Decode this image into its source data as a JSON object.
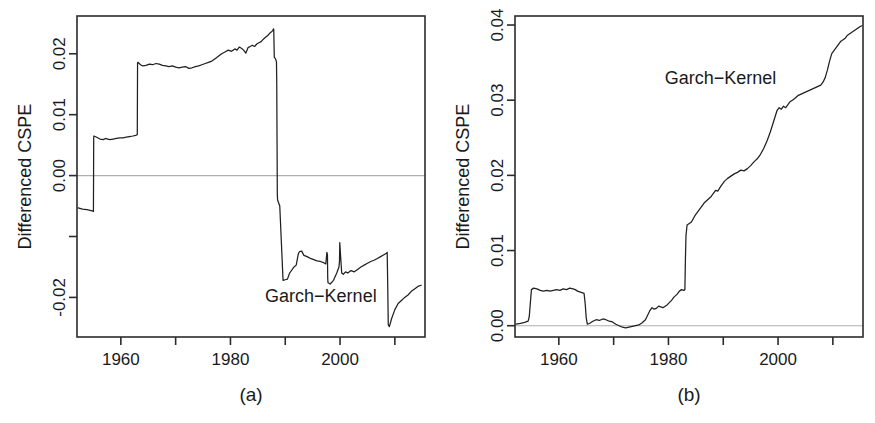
{
  "figure": {
    "width": 875,
    "height": 423,
    "background": "#ffffff",
    "line_color": "#202020",
    "axis_color": "#2b2b2b",
    "zero_line_color": "#aeaeae"
  },
  "chart_data": [
    {
      "id": "panel-a",
      "type": "line",
      "title": "",
      "caption": "(a)",
      "xlabel": "",
      "ylabel": "Differenced CSPE",
      "series_label": "Garch-Kernel",
      "series_label_x": 1996.5,
      "series_label_y": -0.0208,
      "grid": false,
      "zero_line": true,
      "xlim": [
        1952.0,
        2015.5
      ],
      "ylim": [
        -0.0265,
        0.0262
      ],
      "xticks": [
        1960,
        1970,
        1980,
        1990,
        2000,
        2010
      ],
      "xtick_labels": [
        "1960",
        "",
        "1980",
        "",
        "2000",
        ""
      ],
      "yticks": [
        0.02,
        0.01,
        0.0,
        -0.01,
        -0.02
      ],
      "ytick_labels": [
        "0.02",
        "0.01",
        "0.00",
        "",
        "-0.02"
      ],
      "series": [
        {
          "name": "Garch-Kernel",
          "x": [
            1952.2,
            1953.0,
            1953.8,
            1954.4,
            1954.8,
            1955.0,
            1955.05,
            1955.1,
            1955.6,
            1956.2,
            1956.8,
            1957.2,
            1957.6,
            1958.0,
            1958.6,
            1959.2,
            1959.8,
            1960.4,
            1961.0,
            1961.6,
            1962.2,
            1962.7,
            1963.0,
            1963.05,
            1963.1,
            1963.6,
            1964.0,
            1964.6,
            1965.2,
            1965.8,
            1966.4,
            1967.0,
            1967.6,
            1968.2,
            1968.8,
            1969.4,
            1970.0,
            1970.6,
            1971.2,
            1971.8,
            1972.4,
            1973.0,
            1973.6,
            1974.2,
            1974.8,
            1975.4,
            1976.0,
            1976.6,
            1977.2,
            1977.8,
            1978.4,
            1979.0,
            1979.6,
            1980.2,
            1980.8,
            1981.2,
            1981.6,
            1982.0,
            1982.4,
            1982.8,
            1983.2,
            1983.6,
            1984.0,
            1984.4,
            1984.8,
            1985.2,
            1985.6,
            1986.0,
            1986.4,
            1986.8,
            1987.2,
            1987.5,
            1987.7,
            1987.8,
            1987.85,
            1987.9,
            1988.0,
            1988.2,
            1988.3,
            1988.35,
            1988.4,
            1988.45,
            1988.5,
            1988.55,
            1988.6,
            1989.0,
            1989.6,
            1990.0,
            1990.4,
            1990.8,
            1991.2,
            1991.6,
            1992.0,
            1992.4,
            1992.6,
            1993.0,
            1993.4,
            1994.0,
            1994.6,
            1995.2,
            1995.8,
            1996.4,
            1997.0,
            1997.4,
            1997.6,
            1997.7,
            1997.75,
            1997.8,
            1998.2,
            1998.8,
            1999.4,
            1999.8,
            1999.9,
            1999.95,
            2000.0,
            2000.3,
            2000.6,
            2001.0,
            2001.4,
            2002.0,
            2002.6,
            2003.2,
            2003.8,
            2004.4,
            2005.0,
            2005.6,
            2006.2,
            2006.8,
            2007.4,
            2008.0,
            2008.4,
            2008.6,
            2008.7,
            2008.75,
            2008.8,
            2009.0,
            2009.4,
            2010.0,
            2010.6,
            2011.2,
            2011.8,
            2012.4,
            2013.0,
            2013.6,
            2014.2,
            2014.8,
            2015.3
          ],
          "y": [
            -0.0053,
            -0.0055,
            -0.0056,
            -0.0057,
            -0.0058,
            -0.0059,
            0.0063,
            0.0065,
            0.0063,
            0.006,
            0.0059,
            0.0061,
            0.006,
            0.0059,
            0.006,
            0.0061,
            0.0062,
            0.0062,
            0.0063,
            0.0064,
            0.0065,
            0.0066,
            0.0067,
            0.0185,
            0.0186,
            0.0182,
            0.018,
            0.0181,
            0.0183,
            0.0182,
            0.0184,
            0.0183,
            0.0181,
            0.018,
            0.0179,
            0.018,
            0.0178,
            0.0177,
            0.0178,
            0.0179,
            0.0176,
            0.0177,
            0.0179,
            0.018,
            0.0182,
            0.0184,
            0.0186,
            0.0188,
            0.0192,
            0.0196,
            0.02,
            0.0203,
            0.0206,
            0.0204,
            0.0208,
            0.0206,
            0.0211,
            0.0209,
            0.0206,
            0.0201,
            0.021,
            0.0212,
            0.0214,
            0.0212,
            0.0216,
            0.0218,
            0.022,
            0.0224,
            0.0227,
            0.023,
            0.0234,
            0.0236,
            0.0238,
            0.024,
            0.0241,
            0.024,
            0.0194,
            0.0192,
            0.019,
            0.0188,
            0.0186,
            0.015,
            0.006,
            -0.003,
            -0.004,
            -0.005,
            -0.0172,
            -0.0171,
            -0.017,
            -0.016,
            -0.0155,
            -0.015,
            -0.0147,
            -0.0128,
            -0.0125,
            -0.0124,
            -0.0131,
            -0.0133,
            -0.0136,
            -0.0138,
            -0.014,
            -0.0141,
            -0.0143,
            -0.0145,
            -0.0126,
            -0.013,
            -0.0168,
            -0.0176,
            -0.0178,
            -0.0172,
            -0.016,
            -0.015,
            -0.014,
            -0.011,
            -0.0118,
            -0.016,
            -0.0162,
            -0.0158,
            -0.016,
            -0.0156,
            -0.0158,
            -0.0154,
            -0.015,
            -0.0147,
            -0.0144,
            -0.0141,
            -0.0139,
            -0.0136,
            -0.0133,
            -0.013,
            -0.0128,
            -0.0126,
            -0.018,
            -0.0215,
            -0.0245,
            -0.0248,
            -0.0235,
            -0.022,
            -0.021,
            -0.0205,
            -0.02,
            -0.0196,
            -0.019,
            -0.0186,
            -0.0182,
            -0.018
          ]
        }
      ]
    },
    {
      "id": "panel-b",
      "type": "line",
      "title": "",
      "caption": "(b)",
      "xlabel": "",
      "ylabel": "Differenced CSPE",
      "series_label": "Garch-Kernel",
      "series_label_x": 1989.5,
      "series_label_y": 0.0322,
      "grid": false,
      "zero_line": true,
      "xlim": [
        1952.0,
        2015.5
      ],
      "ylim": [
        -0.0015,
        0.0412
      ],
      "xticks": [
        1960,
        1970,
        1980,
        1990,
        2000,
        2010
      ],
      "xtick_labels": [
        "1960",
        "",
        "1980",
        "",
        "2000",
        ""
      ],
      "yticks": [
        0.0,
        0.01,
        0.02,
        0.03,
        0.04
      ],
      "ytick_labels": [
        "0.00",
        "0.01",
        "0.02",
        "0.03",
        "0.04"
      ],
      "series": [
        {
          "name": "Garch-Kernel",
          "x": [
            1952.2,
            1953.0,
            1953.6,
            1954.0,
            1954.4,
            1954.6,
            1954.8,
            1955.0,
            1955.4,
            1956.0,
            1956.6,
            1957.2,
            1957.8,
            1958.4,
            1959.0,
            1959.6,
            1960.2,
            1960.8,
            1961.4,
            1962.0,
            1962.6,
            1963.0,
            1963.4,
            1963.8,
            1964.2,
            1964.6,
            1964.8,
            1965.0,
            1965.2,
            1965.6,
            1966.2,
            1966.8,
            1967.4,
            1968.0,
            1968.6,
            1969.2,
            1969.8,
            1970.4,
            1971.0,
            1971.6,
            1972.2,
            1972.8,
            1973.4,
            1974.0,
            1974.6,
            1975.2,
            1975.8,
            1976.2,
            1976.6,
            1977.0,
            1977.4,
            1977.8,
            1978.2,
            1978.6,
            1979.0,
            1979.4,
            1979.8,
            1980.2,
            1980.6,
            1981.0,
            1981.6,
            1982.0,
            1982.4,
            1982.8,
            1983.0,
            1983.1,
            1983.2,
            1983.4,
            1983.8,
            1984.2,
            1984.8,
            1985.4,
            1986.0,
            1986.6,
            1987.2,
            1987.8,
            1988.2,
            1988.6,
            1989.0,
            1989.6,
            1990.2,
            1990.8,
            1991.4,
            1992.0,
            1992.6,
            1993.2,
            1993.8,
            1994.4,
            1995.0,
            1995.6,
            1996.2,
            1996.8,
            1997.4,
            1998.0,
            1998.6,
            1999.2,
            1999.8,
            2000.2,
            2000.6,
            2001.0,
            2001.4,
            2001.8,
            2002.2,
            2002.6,
            2003.0,
            2003.6,
            2004.2,
            2004.8,
            2005.4,
            2006.0,
            2006.6,
            2007.2,
            2007.8,
            2008.2,
            2008.6,
            2009.0,
            2009.4,
            2009.8,
            2010.2,
            2010.6,
            2011.0,
            2011.4,
            2011.8,
            2012.2,
            2012.6,
            2013.0,
            2013.4,
            2013.8,
            2014.2,
            2014.6,
            2015.0,
            2015.3
          ],
          "y": [
            0.0002,
            0.0003,
            0.0004,
            0.0005,
            0.0006,
            0.0012,
            0.003,
            0.0048,
            0.005,
            0.0049,
            0.0047,
            0.0046,
            0.0047,
            0.0046,
            0.0047,
            0.0048,
            0.0047,
            0.0049,
            0.0048,
            0.005,
            0.0049,
            0.0048,
            0.0046,
            0.0045,
            0.0044,
            0.0043,
            0.003,
            0.001,
            0.0002,
            0.0003,
            0.0006,
            0.0008,
            0.0007,
            0.0009,
            0.0008,
            0.0006,
            0.0005,
            0.0002,
            0.0,
            -0.0002,
            -0.0003,
            -0.0002,
            -0.0001,
            0.0,
            0.0001,
            0.0004,
            0.0008,
            0.0014,
            0.002,
            0.0024,
            0.0022,
            0.0023,
            0.0026,
            0.0025,
            0.0024,
            0.0026,
            0.0028,
            0.0031,
            0.0034,
            0.0038,
            0.0042,
            0.0046,
            0.0048,
            0.0047,
            0.0048,
            0.009,
            0.012,
            0.0134,
            0.0136,
            0.0138,
            0.0146,
            0.0152,
            0.0158,
            0.0164,
            0.0168,
            0.0172,
            0.0176,
            0.018,
            0.0179,
            0.0186,
            0.0192,
            0.0196,
            0.0199,
            0.0202,
            0.0204,
            0.0207,
            0.0206,
            0.0209,
            0.0213,
            0.0218,
            0.0222,
            0.0228,
            0.0236,
            0.0246,
            0.0258,
            0.0272,
            0.0286,
            0.029,
            0.0288,
            0.0292,
            0.029,
            0.0294,
            0.0298,
            0.03,
            0.0302,
            0.0306,
            0.0308,
            0.031,
            0.0312,
            0.0314,
            0.0316,
            0.0318,
            0.032,
            0.0324,
            0.033,
            0.034,
            0.0352,
            0.0362,
            0.0366,
            0.037,
            0.0374,
            0.0378,
            0.038,
            0.0382,
            0.0386,
            0.0388,
            0.039,
            0.0392,
            0.0394,
            0.0396,
            0.0398,
            0.0399,
            0.04
          ]
        }
      ]
    }
  ]
}
